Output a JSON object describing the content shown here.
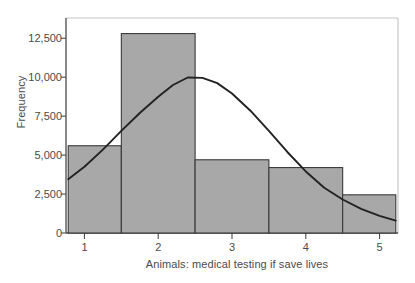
{
  "chart_data": {
    "type": "bar",
    "title": "",
    "subtitle": "",
    "xlabel": "Animals: medical testing if save lives",
    "ylabel": "Frequency",
    "grid": false,
    "legend": "none",
    "xlim": [
      0.75,
      5.25
    ],
    "ylim": [
      0,
      13800
    ],
    "xticks": [
      1,
      2,
      3,
      4,
      5
    ],
    "xtick_labels": [
      "1",
      "2",
      "3",
      "4",
      "5"
    ],
    "yticks": [
      0,
      2500,
      5000,
      7500,
      10000,
      12500
    ],
    "ytick_labels": [
      "0",
      "2,500",
      "5,000",
      "7,500",
      "10,000",
      "12,500"
    ],
    "bin_edges": [
      0.78,
      1.5,
      2.5,
      3.5,
      4.5,
      5.22
    ],
    "categories": [
      "1",
      "2",
      "3",
      "4",
      "5"
    ],
    "values": [
      5600,
      12800,
      4700,
      4200,
      2450
    ],
    "bar_color": "#a8a8a8",
    "bar_edge_color": "#3a3a3a",
    "series": [
      {
        "name": "Frequency",
        "values": [
          5600,
          12800,
          4700,
          4200,
          2450
        ]
      },
      {
        "name": "Normal curve",
        "type": "line",
        "color": "#222222",
        "peak_y": 10000,
        "peak_x": 2.4,
        "start_y": 3450,
        "end_y": 800,
        "points": [
          [
            0.78,
            3450
          ],
          [
            1.0,
            4250
          ],
          [
            1.25,
            5350
          ],
          [
            1.5,
            6550
          ],
          [
            1.75,
            7700
          ],
          [
            2.0,
            8750
          ],
          [
            2.2,
            9500
          ],
          [
            2.4,
            9980
          ],
          [
            2.6,
            9960
          ],
          [
            2.8,
            9620
          ],
          [
            3.0,
            8950
          ],
          [
            3.25,
            7850
          ],
          [
            3.5,
            6550
          ],
          [
            3.75,
            5200
          ],
          [
            4.0,
            3950
          ],
          [
            4.25,
            2900
          ],
          [
            4.5,
            2150
          ],
          [
            4.75,
            1550
          ],
          [
            5.0,
            1100
          ],
          [
            5.22,
            800
          ]
        ]
      }
    ],
    "axis_color": "#3a3a3a",
    "frame_color": "#c8c8c8"
  }
}
